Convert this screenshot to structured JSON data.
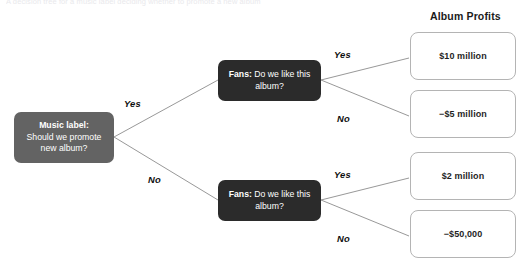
{
  "diagram": {
    "type": "decision-tree",
    "top_clipped_text": "A decision tree for a music label deciding whether to promote a new album",
    "outcome_column_heading": "Album Profits",
    "colors": {
      "decision_node_fill": "#636363",
      "chance_node_fill": "#2b2b2b",
      "node_text": "#ffffff",
      "outcome_border": "#b4b4b4",
      "outcome_fill": "#ffffff",
      "link_stroke": "#8c8c8c",
      "background": "#ffffff"
    }
  },
  "root": {
    "id": "music-label",
    "lead": "Music label:",
    "question": "Should we promote new album?",
    "kind": "decision"
  },
  "chance_nodes": [
    {
      "id": "fans-top",
      "lead": "Fans:",
      "question": "Do we like this album?",
      "kind": "chance"
    },
    {
      "id": "fans-bottom",
      "lead": "Fans:",
      "question": "Do we like this album?",
      "kind": "chance"
    }
  ],
  "edge_labels": {
    "root_yes": "Yes",
    "root_no": "No",
    "top_yes": "Yes",
    "top_no": "No",
    "bottom_yes": "Yes",
    "bottom_no": "No"
  },
  "outcomes": [
    {
      "id": "outcome-1",
      "value": "$10 million",
      "path": "promote yes / fans like yes"
    },
    {
      "id": "outcome-2",
      "value": "−$5 million",
      "path": "promote yes / fans like no"
    },
    {
      "id": "outcome-3",
      "value": "$2 million",
      "path": "promote no / fans like yes"
    },
    {
      "id": "outcome-4",
      "value": "−$50,000",
      "path": "promote no / fans like no"
    }
  ]
}
